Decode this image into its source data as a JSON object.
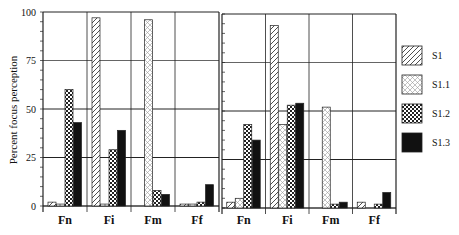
{
  "chart_data": {
    "type": "bar",
    "ylabel": "Percent focus perception",
    "ylim": [
      0,
      100
    ],
    "yticks": [
      0,
      25,
      50,
      75,
      100
    ],
    "categories": [
      "Fn",
      "Fi",
      "Fm",
      "Ff"
    ],
    "legend": [
      "S1",
      "S1.1",
      "S1.2",
      "S1.3"
    ],
    "legend_position": "right",
    "grid": true,
    "panels": [
      {
        "name": "left",
        "series": [
          {
            "name": "S1",
            "values": [
              2,
              97,
              0,
              1
            ]
          },
          {
            "name": "S1.1",
            "values": [
              1,
              1,
              96,
              1
            ]
          },
          {
            "name": "S1.2",
            "values": [
              60,
              29,
              8,
              2
            ]
          },
          {
            "name": "S1.3",
            "values": [
              43,
              39,
              6,
              11
            ]
          }
        ]
      },
      {
        "name": "right",
        "series": [
          {
            "name": "S1",
            "values": [
              3,
              94,
              0,
              3
            ]
          },
          {
            "name": "S1.1",
            "values": [
              5,
              43,
              52,
              0
            ]
          },
          {
            "name": "S1.2",
            "values": [
              43,
              53,
              2,
              2
            ]
          },
          {
            "name": "S1.3",
            "values": [
              35,
              54,
              3,
              8
            ]
          }
        ]
      }
    ]
  },
  "axis": {
    "ylabel": "Percent focus perception",
    "ytick_labels": [
      "0",
      "25",
      "50",
      "75",
      "100"
    ]
  },
  "legend": {
    "items": [
      {
        "label": "S1",
        "pattern": "diagonal-hatch"
      },
      {
        "label": "S1.1",
        "pattern": "crosshatch-light"
      },
      {
        "label": "S1.2",
        "pattern": "checker"
      },
      {
        "label": "S1.3",
        "pattern": "solid-black"
      }
    ]
  },
  "colors": {
    "ink": "#111111",
    "background": "#ffffff"
  }
}
